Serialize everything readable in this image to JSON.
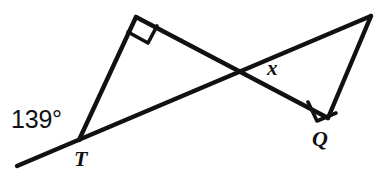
{
  "figure": {
    "kind": "geometry-diagram",
    "background_color": "#ffffff",
    "stroke_color": "#111111",
    "stroke_width": 4,
    "width": 388,
    "height": 179,
    "labels": {
      "angle_T": "139°",
      "vertex_T": "T",
      "vertex_Q": "Q",
      "unknown_angle": "x"
    },
    "label_positions": {
      "angle_T": {
        "x": 11,
        "y": 107
      },
      "vertex_T": {
        "x": 74,
        "y": 148
      },
      "vertex_Q": {
        "x": 312,
        "y": 128
      },
      "unknown_angle": {
        "x": 267,
        "y": 58
      }
    },
    "points": {
      "ray_end_lower_left": {
        "x": 17,
        "y": 166
      },
      "T": {
        "x": 79,
        "y": 140
      },
      "apex_left": {
        "x": 136,
        "y": 17
      },
      "intersection": {
        "x": 246,
        "y": 75
      },
      "Q": {
        "x": 328,
        "y": 118
      },
      "apex_right": {
        "x": 371,
        "y": 16
      }
    },
    "segments": [
      {
        "name": "ray-through-T",
        "from": "ray_end_lower_left",
        "to": "apex_right"
      },
      {
        "name": "leg-T-to-apex-left",
        "from": "T",
        "to": "apex_left"
      },
      {
        "name": "hypotenuse-apex-left-to-Q",
        "from": "apex_left",
        "to": "Q"
      },
      {
        "name": "leg-Q-to-apex-right",
        "from": "Q",
        "to": "apex_right"
      }
    ],
    "right_angle_marks": [
      {
        "name": "right-angle-apex-left",
        "vertex": "apex_left"
      },
      {
        "name": "right-angle-Q",
        "vertex": "Q"
      }
    ]
  }
}
